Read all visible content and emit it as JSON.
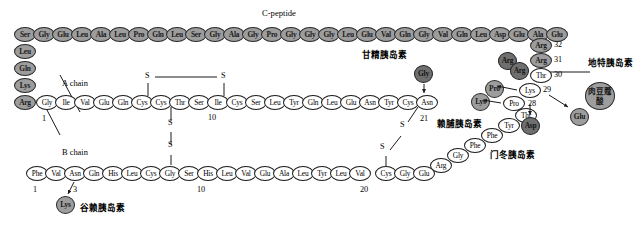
{
  "figure": {
    "title_cpeptide": "C-peptide",
    "label_a_chain": "A chain",
    "label_b_chain": "B chain"
  },
  "c_peptide": {
    "top_row": [
      "Ser",
      "Gly",
      "Glu",
      "Leu",
      "Ala",
      "Leu",
      "Pro",
      "Gln",
      "Leu",
      "Ser",
      "Gly",
      "Ala",
      "Gly",
      "Pro",
      "Gly",
      "Gly",
      "Gly",
      "Leu",
      "Glu",
      "Val",
      "Gln",
      "Gly",
      "Val",
      "Gln",
      "Leu",
      "Asp",
      "Glu",
      "Ala",
      "Glu"
    ],
    "left_column": [
      "Leu",
      "Gln",
      "Lys",
      "Arg"
    ]
  },
  "a_chain": {
    "residues": [
      "Gly",
      "Ile",
      "Val",
      "Glu",
      "Gln",
      "Cys",
      "Cys",
      "Thr",
      "Ser",
      "Ile",
      "Cys",
      "Ser",
      "Leu",
      "Tyr",
      "Gln",
      "Leu",
      "Glu",
      "Asn",
      "Tyr",
      "Cys",
      "Asn"
    ],
    "numbers": {
      "start": "1",
      "ten": "10",
      "end": "21"
    }
  },
  "b_chain": {
    "main_residues": [
      "Phe",
      "Val",
      "Asn",
      "Gln",
      "His",
      "Leu",
      "Cys",
      "Gly",
      "Ser",
      "His",
      "Leu",
      "Val",
      "Glu",
      "Ala",
      "Leu",
      "Tyr",
      "Leu",
      "Val",
      "Cys",
      "Gly",
      "Glu"
    ],
    "tail_residues": [
      "Arg",
      "Gly",
      "Phe",
      "Phe",
      "Tyr",
      "Thr"
    ],
    "terminal_residues": [
      "Lys",
      "Pro",
      "Thr"
    ],
    "numbers": {
      "start": "1",
      "three": "3",
      "ten": "10",
      "twenty": "20",
      "twentyeight": "28",
      "twentynine": "29",
      "thirty": "30",
      "thirtyone": "31",
      "thirtytwo": "32"
    }
  },
  "analogs": {
    "glargine": {
      "name": "甘精胰岛素",
      "added": [
        "Arg",
        "Arg"
      ],
      "positions": [
        "31",
        "32"
      ]
    },
    "detemir": {
      "name": "地特胰岛素",
      "fatty_acid": "肉豆蔻酸",
      "removed": "Thr"
    },
    "lispro": {
      "name": "赖脯胰岛素",
      "swapped": [
        "Lys",
        "Pro"
      ]
    },
    "aspart": {
      "name": "门冬胰岛素",
      "substitution": "Asp",
      "position": "28"
    },
    "glulisine": {
      "name": "谷赖胰岛素",
      "substitutions": [
        "Lys",
        "Glu"
      ],
      "positions": [
        "3",
        "29"
      ]
    },
    "gly_a21": {
      "substitution": "Gly"
    }
  },
  "disulfides": {
    "sulfur": "S",
    "bonds": [
      "A6-A11",
      "A7-B7",
      "A20-B19"
    ]
  }
}
